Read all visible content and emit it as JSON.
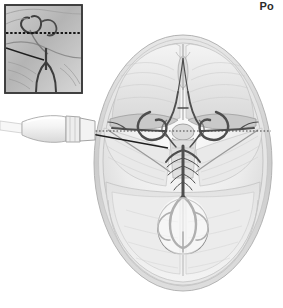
{
  "figure": {
    "name": "transcranial-doppler-skull-base",
    "view": "axial superior view of skull base",
    "background_color": "#ffffff",
    "width": 283,
    "height": 308
  },
  "labels": {
    "top_right": "Po"
  },
  "inset": {
    "name": "sagittal-detail-inset",
    "border_color": "#3a3a3a",
    "x": 5,
    "y": 5,
    "width": 77,
    "height": 88,
    "dashed_line_label": "",
    "dashed_line_y": 33
  },
  "probe": {
    "name": "ultrasound-transducer",
    "body_color": "#f2f2f2",
    "outline_color": "#9a9a9a",
    "contact_x": 95,
    "contact_y": 131
  },
  "beam": {
    "dotted_line_color": "#4a4a4a",
    "solid_line_color": "#222222",
    "dotted_start_x": 78,
    "dotted_end_x": 271,
    "dotted_y": 131,
    "solid_end_x": 168,
    "solid_end_y": 148
  },
  "anatomy": {
    "skull_outer_color": "#d9d9d9",
    "skull_inner_color": "#efefef",
    "brain_tissue_color": "#e4e4e4",
    "vessel_color": "#4e4e4e",
    "structures": [
      "cranial vault",
      "anterior cranial fossa",
      "lesser wing of sphenoid",
      "sella turcica",
      "internal carotid artery",
      "middle cerebral artery",
      "anterior cerebral artery",
      "circle of Willis",
      "basilar artery",
      "vertebral artery",
      "posterior cerebral artery",
      "cerebellum",
      "occipital bone"
    ]
  },
  "colors": {
    "ink": "#2b2b2b",
    "mid_gray": "#9a9a9a",
    "light_gray": "#e4e4e4"
  }
}
